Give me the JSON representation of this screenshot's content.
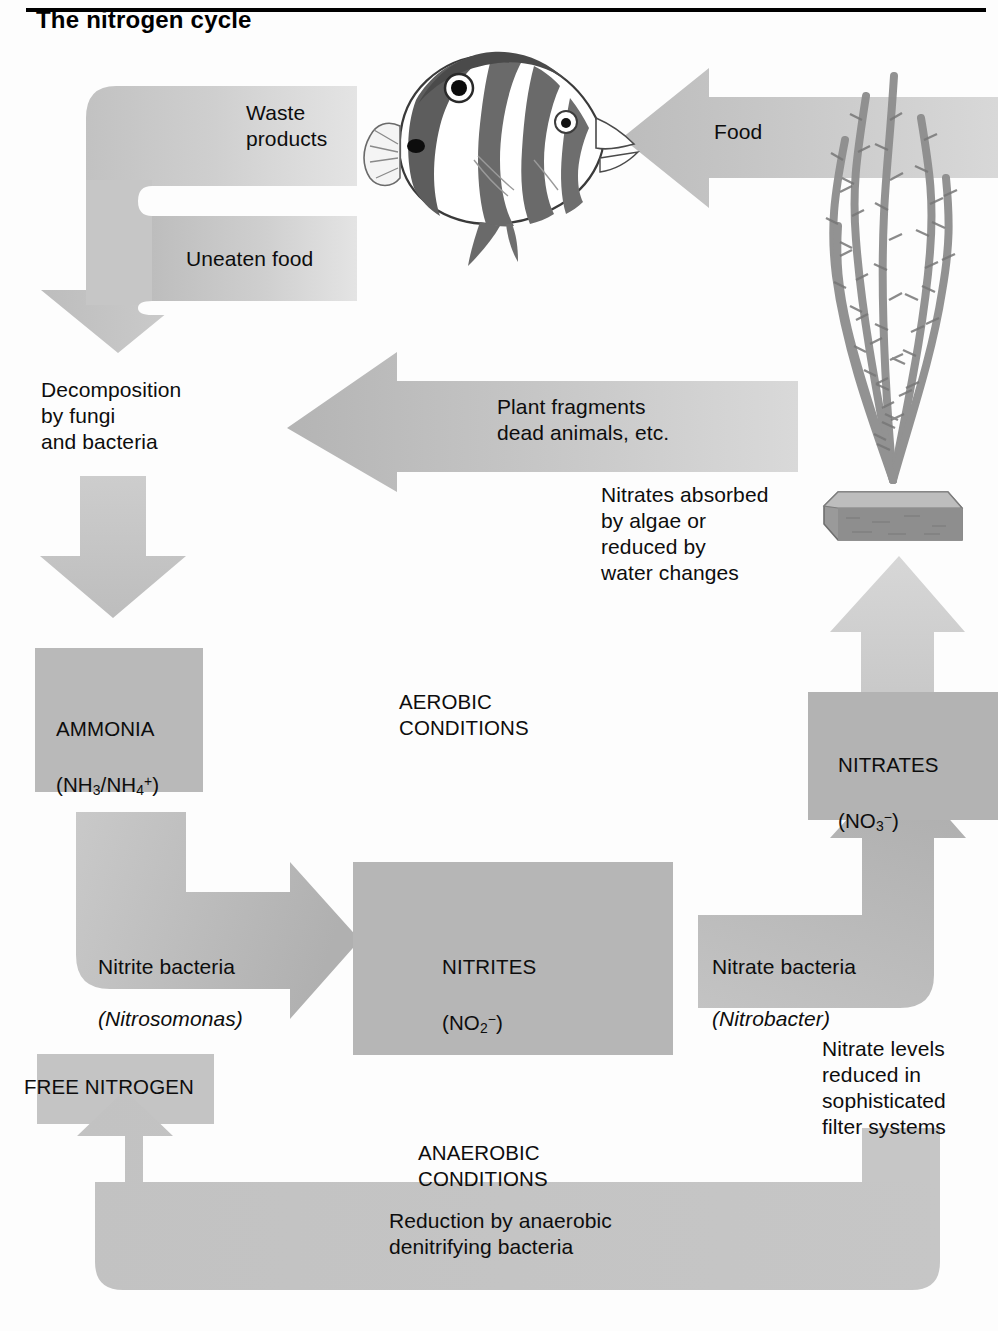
{
  "title": "The nitrogen cycle",
  "colors": {
    "arrow_light": "#c9c9c9",
    "arrow_mid": "#bcbcbc",
    "arrow_dark": "#b0b0b0",
    "box_ammonia": "#b9b9b9",
    "box_nitrites": "#b6b6b6",
    "box_nitrates": "#b3b3b3",
    "box_free_nitrogen": "#c4c4c4",
    "text": "#0d0d0d",
    "rule": "#000000",
    "page_bg": "#fdfdfd"
  },
  "labels": {
    "waste_products": "Waste\nproducts",
    "uneaten_food": "Uneaten food",
    "food": "Food",
    "decomposition": "Decomposition\nby fungi\nand bacteria",
    "plant_fragments": "Plant fragments\ndead animals, etc.",
    "nitrates_absorbed": "Nitrates absorbed\nby algae or\nreduced by\nwater changes",
    "aerobic_conditions": "AEROBIC\nCONDITIONS",
    "anaerobic_conditions": "ANAEROBIC\nCONDITIONS",
    "nitrite_bacteria": "Nitrite bacteria",
    "nitrosomonas": "(Nitrosomonas)",
    "nitrate_bacteria": "Nitrate bacteria",
    "nitrobacter": "(Nitrobacter)",
    "nitrate_levels": "Nitrate levels\nreduced in\nsophisticated\nfilter systems",
    "reduction": "Reduction by anaerobic\ndenitrifying bacteria",
    "free_nitrogen": "FREE NITROGEN"
  },
  "boxes": {
    "ammonia": {
      "name": "AMMONIA",
      "formula_prefix": "(NH",
      "formula_sub1": "3",
      "formula_mid": "/NH",
      "formula_sub2": "4",
      "formula_sup": "+",
      "formula_suffix": ")"
    },
    "nitrites": {
      "name": "NITRITES",
      "formula_prefix": "(NO",
      "formula_sub": "2",
      "formula_sup": "−",
      "formula_suffix": ")"
    },
    "nitrates": {
      "name": "NITRATES",
      "formula_prefix": "(NO",
      "formula_sub": "3",
      "formula_sup": "−",
      "formula_suffix": ")"
    }
  },
  "illustrations": {
    "fish": "butterflyfish",
    "plant": "aquarium-algae-plant"
  }
}
